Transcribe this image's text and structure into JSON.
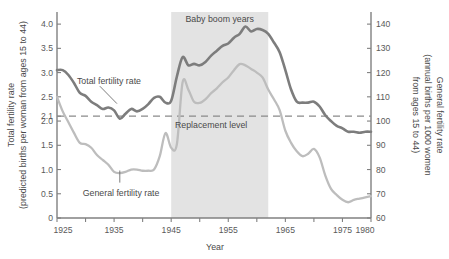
{
  "chart_data": {
    "type": "line",
    "title": "",
    "xlabel": "Year",
    "ylabel": "Total fertility rate (predicted births per woman from ages 15 to 44)",
    "y2label": "General fertility rate (annual births per 1000 women from ages 15 to 44)",
    "xlim": [
      1925,
      1980
    ],
    "ylim": [
      0,
      4.25
    ],
    "y2lim": [
      60,
      145
    ],
    "grid": false,
    "legend_position": "inline-annotations",
    "x_ticks_labeled": [
      "1925",
      "1935",
      "1945",
      "1955",
      "1965",
      "1975",
      "1980"
    ],
    "x_ticks_labeled_values": [
      1925,
      1935,
      1945,
      1955,
      1965,
      1975,
      1980
    ],
    "x_ticks_minor_values": [
      1930,
      1940,
      1950,
      1960,
      1970
    ],
    "y_ticks": [
      "4.0",
      "3.5",
      "3.0",
      "2.5",
      "2.1",
      "2.0",
      "1.5",
      "1.0",
      "0.5",
      "0"
    ],
    "y_tick_values": [
      4.0,
      3.5,
      3.0,
      2.5,
      2.1,
      2.0,
      1.5,
      1.0,
      0.5,
      0
    ],
    "y2_ticks": [
      "140",
      "130",
      "120",
      "110",
      "100",
      "90",
      "80",
      "70",
      "60"
    ],
    "y2_tick_values": [
      140,
      130,
      120,
      110,
      100,
      90,
      80,
      70,
      60
    ],
    "annotations": [
      {
        "name": "baby-boom-band",
        "text": "Baby boom years",
        "x_start": 1945,
        "x_end": 1962
      },
      {
        "name": "replacement-level",
        "text": "Replacement level",
        "y": 2.1
      },
      {
        "name": "total-fertility-rate-label",
        "text": "Total fertility rate"
      },
      {
        "name": "general-fertility-rate-label",
        "text": "General fertility rate"
      }
    ],
    "colors": {
      "total_fertility_rate": "#7d7d7d",
      "general_fertility_rate": "#bdbdbd",
      "band": "#e3e3e3",
      "axis": "#808080",
      "replacement": "#8a8a8a"
    },
    "x": [
      1925,
      1926,
      1927,
      1928,
      1929,
      1930,
      1931,
      1932,
      1933,
      1934,
      1935,
      1936,
      1937,
      1938,
      1939,
      1940,
      1941,
      1942,
      1943,
      1944,
      1945,
      1946,
      1947,
      1948,
      1949,
      1950,
      1951,
      1952,
      1953,
      1954,
      1955,
      1956,
      1957,
      1958,
      1959,
      1960,
      1961,
      1962,
      1963,
      1964,
      1965,
      1966,
      1967,
      1968,
      1969,
      1970,
      1971,
      1972,
      1973,
      1974,
      1975,
      1976,
      1977,
      1978,
      1979,
      1980
    ],
    "series": [
      {
        "name": "Total fertility rate",
        "axis": "left",
        "units": "predicted births per woman from ages 15 to 44",
        "values": [
          3.05,
          3.05,
          2.95,
          2.78,
          2.58,
          2.52,
          2.4,
          2.33,
          2.25,
          2.28,
          2.22,
          2.05,
          2.15,
          2.25,
          2.2,
          2.25,
          2.35,
          2.48,
          2.5,
          2.38,
          2.42,
          2.92,
          3.32,
          3.15,
          3.18,
          3.15,
          3.22,
          3.35,
          3.45,
          3.55,
          3.6,
          3.72,
          3.8,
          3.95,
          3.85,
          3.9,
          3.88,
          3.8,
          3.62,
          3.42,
          3.05,
          2.65,
          2.4,
          2.38,
          2.38,
          2.4,
          2.3,
          2.12,
          2.0,
          1.9,
          1.85,
          1.78,
          1.78,
          1.76,
          1.78,
          1.78
        ]
      },
      {
        "name": "General fertility rate",
        "axis": "right",
        "units": "annual births per 1000 women from ages 15 to 44",
        "values": [
          110.0,
          104.0,
          99.5,
          95.0,
          91.0,
          90.5,
          89.0,
          86.0,
          84.0,
          82.0,
          79.0,
          78.5,
          79.0,
          80.0,
          80.0,
          79.5,
          79.5,
          80.0,
          85.5,
          95.0,
          89.0,
          90.5,
          116.0,
          113.0,
          108.0,
          107.5,
          109.0,
          111.5,
          113.5,
          116.0,
          118.0,
          121.0,
          123.5,
          123.0,
          121.5,
          120.0,
          118.0,
          113.0,
          109.0,
          104.5,
          96.0,
          91.0,
          87.5,
          85.5,
          86.5,
          88.5,
          85.0,
          77.5,
          72.0,
          69.5,
          67.5,
          66.5,
          67.5,
          68.0,
          68.5,
          69.0
        ]
      }
    ]
  },
  "labels": {
    "y_axis_title_line1": "Total fertility rate",
    "y_axis_title_line2": "(predicted births per woman from ages 15 to 44)",
    "y2_axis_title_line1": "General fertility rate",
    "y2_axis_title_line2": "(annual births per 1000 women",
    "y2_axis_title_line3": "from ages 15 to 44)",
    "x_axis_title": "Year",
    "band_label": "Baby boom years",
    "replacement_label": "Replacement level",
    "tfr_label": "Total fertility rate",
    "gfr_label": "General fertility rate"
  }
}
